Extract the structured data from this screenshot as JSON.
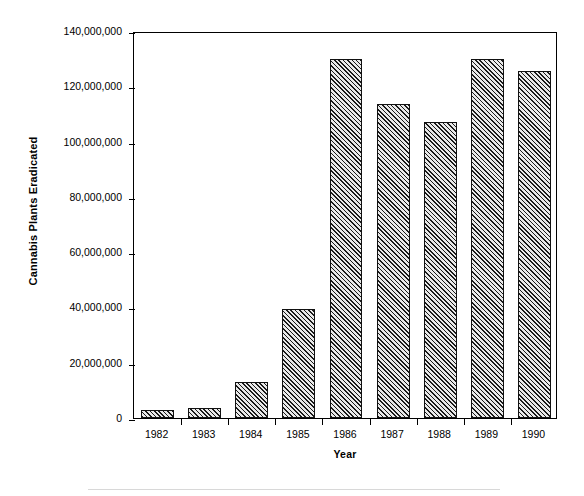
{
  "chart_data": {
    "type": "bar",
    "title": "",
    "xlabel": "Year",
    "ylabel": "Cannabis Plants Eradicated",
    "categories": [
      "1982",
      "1983",
      "1984",
      "1985",
      "1986",
      "1987",
      "1988",
      "1989",
      "1990"
    ],
    "values": [
      2800000,
      3700000,
      13000000,
      39400000,
      130000000,
      113500000,
      107000000,
      130000000,
      125500000
    ],
    "ylim": [
      0,
      140000000
    ],
    "xlim_note": "categorical",
    "ytick_values": [
      0,
      20000000,
      40000000,
      60000000,
      80000000,
      100000000,
      120000000,
      140000000
    ],
    "ytick_labels": [
      "0",
      "20,000,000",
      "40,000,000",
      "60,000,000",
      "80,000,000",
      "100,000,000",
      "120,000,000",
      "140,000,000"
    ],
    "grid": false,
    "legend": null,
    "legend_position": "none",
    "bar_fill": "diagonal-hatch",
    "bar_edge_color": "#111111",
    "frame_color": "#000000",
    "background_color": "#ffffff"
  },
  "axes": {
    "y_title": "Cannabis Plants Eradicated",
    "x_title": "Year"
  }
}
